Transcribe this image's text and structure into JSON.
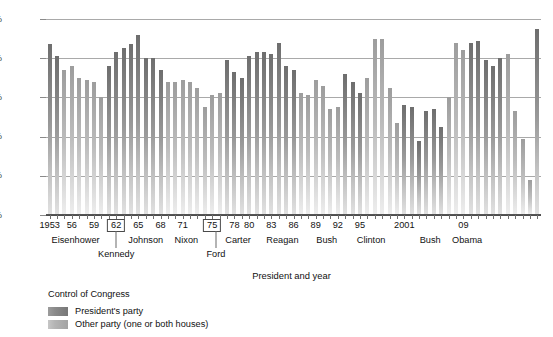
{
  "chart_data": {
    "type": "bar",
    "title": "",
    "xlabel": "President and year",
    "ylabel": "",
    "ylim": [
      0,
      100
    ],
    "ytick_labels": [
      "0%",
      "20%",
      "40%",
      "60%",
      "80%",
      "100%"
    ],
    "ytick_values": [
      0,
      20,
      40,
      60,
      80,
      100
    ],
    "grid": true,
    "legend_title": "Control of Congress",
    "legend": [
      {
        "key": "p",
        "label": "President's party"
      },
      {
        "key": "o",
        "label": "Other party (one or both houses)"
      }
    ],
    "x_tick_labels": [
      {
        "year": 1953,
        "label": "1953",
        "boxed": false
      },
      {
        "year": 1956,
        "label": "56",
        "boxed": false
      },
      {
        "year": 1959,
        "label": "59",
        "boxed": false
      },
      {
        "year": 1962,
        "label": "62",
        "boxed": true
      },
      {
        "year": 1965,
        "label": "65",
        "boxed": false
      },
      {
        "year": 1968,
        "label": "68",
        "boxed": false
      },
      {
        "year": 1971,
        "label": "71",
        "boxed": false
      },
      {
        "year": 1975,
        "label": "75",
        "boxed": true
      },
      {
        "year": 1978,
        "label": "78",
        "boxed": false
      },
      {
        "year": 1980,
        "label": "80",
        "boxed": false
      },
      {
        "year": 1983,
        "label": "83",
        "boxed": false
      },
      {
        "year": 1986,
        "label": "86",
        "boxed": false
      },
      {
        "year": 1989,
        "label": "89",
        "boxed": false
      },
      {
        "year": 1992,
        "label": "92",
        "boxed": false
      },
      {
        "year": 1995,
        "label": "95",
        "boxed": false
      },
      {
        "year": 2001,
        "label": "2001",
        "boxed": false
      },
      {
        "year": 2009,
        "label": "09",
        "boxed": false
      }
    ],
    "presidents": [
      {
        "name": "Eisenhower",
        "row": 1,
        "start": 1953,
        "end": 1960
      },
      {
        "name": "Kennedy",
        "row": 2,
        "start": 1961,
        "end": 1963
      },
      {
        "name": "Johnson",
        "row": 1,
        "start": 1964,
        "end": 1968
      },
      {
        "name": "Nixon",
        "row": 1,
        "start": 1969,
        "end": 1974
      },
      {
        "name": "Ford",
        "row": 2,
        "start": 1975,
        "end": 1976
      },
      {
        "name": "Carter",
        "row": 1,
        "start": 1977,
        "end": 1980
      },
      {
        "name": "Reagan",
        "row": 1,
        "start": 1981,
        "end": 1988
      },
      {
        "name": "Bush",
        "row": 1,
        "start": 1989,
        "end": 1992
      },
      {
        "name": "Clinton",
        "row": 1,
        "start": 1993,
        "end": 2000
      },
      {
        "name": "Bush",
        "row": 1,
        "start": 2001,
        "end": 2008
      },
      {
        "name": "Obama",
        "row": 1,
        "start": 2009,
        "end": 2010
      }
    ],
    "series_colors": {
      "presidents_party": "#7d7d7d",
      "other_party": "#aaaaaa",
      "gridline": "#a9a9a9",
      "axis": "#4d4d4d"
    },
    "points": [
      {
        "year": 1953,
        "value": 87,
        "party": "p"
      },
      {
        "year": 1954,
        "value": 81,
        "party": "p"
      },
      {
        "year": 1955,
        "value": 74,
        "party": "o"
      },
      {
        "year": 1956,
        "value": 76,
        "party": "o"
      },
      {
        "year": 1957,
        "value": 70,
        "party": "o"
      },
      {
        "year": 1958,
        "value": 69,
        "party": "o"
      },
      {
        "year": 1959,
        "value": 68,
        "party": "o"
      },
      {
        "year": 1960,
        "value": 60,
        "party": "o"
      },
      {
        "year": 1961,
        "value": 76,
        "party": "p"
      },
      {
        "year": 1962,
        "value": 83,
        "party": "p"
      },
      {
        "year": 1963,
        "value": 85,
        "party": "p"
      },
      {
        "year": 1964,
        "value": 87,
        "party": "p"
      },
      {
        "year": 1965,
        "value": 92,
        "party": "p"
      },
      {
        "year": 1966,
        "value": 80,
        "party": "p"
      },
      {
        "year": 1967,
        "value": 80,
        "party": "p"
      },
      {
        "year": 1968,
        "value": 74,
        "party": "p"
      },
      {
        "year": 1969,
        "value": 68,
        "party": "o"
      },
      {
        "year": 1970,
        "value": 68,
        "party": "o"
      },
      {
        "year": 1971,
        "value": 69,
        "party": "o"
      },
      {
        "year": 1972,
        "value": 68,
        "party": "o"
      },
      {
        "year": 1973,
        "value": 65,
        "party": "o"
      },
      {
        "year": 1974,
        "value": 55,
        "party": "o"
      },
      {
        "year": 1975,
        "value": 61,
        "party": "o"
      },
      {
        "year": 1976,
        "value": 62,
        "party": "o"
      },
      {
        "year": 1977,
        "value": 79,
        "party": "p"
      },
      {
        "year": 1978,
        "value": 73,
        "party": "p"
      },
      {
        "year": 1979,
        "value": 70,
        "party": "p"
      },
      {
        "year": 1980,
        "value": 81,
        "party": "p"
      },
      {
        "year": 1981,
        "value": 83,
        "party": "p"
      },
      {
        "year": 1982,
        "value": 83,
        "party": "p"
      },
      {
        "year": 1983,
        "value": 82,
        "party": "p"
      },
      {
        "year": 1984,
        "value": 88,
        "party": "p"
      },
      {
        "year": 1985,
        "value": 76,
        "party": "p"
      },
      {
        "year": 1986,
        "value": 74,
        "party": "p"
      },
      {
        "year": 1987,
        "value": 62,
        "party": "o"
      },
      {
        "year": 1988,
        "value": 61,
        "party": "o"
      },
      {
        "year": 1989,
        "value": 69,
        "party": "o"
      },
      {
        "year": 1990,
        "value": 66,
        "party": "o"
      },
      {
        "year": 1991,
        "value": 54,
        "party": "o"
      },
      {
        "year": 1992,
        "value": 55,
        "party": "o"
      },
      {
        "year": 1993,
        "value": 72,
        "party": "p"
      },
      {
        "year": 1994,
        "value": 68,
        "party": "p"
      },
      {
        "year": 1995,
        "value": 62,
        "party": "p"
      },
      {
        "year": 1996,
        "value": 70,
        "party": "o"
      },
      {
        "year": 1997,
        "value": 90,
        "party": "o"
      },
      {
        "year": 1998,
        "value": 90,
        "party": "o"
      },
      {
        "year": 1999,
        "value": 65,
        "party": "o"
      },
      {
        "year": 2000,
        "value": 47,
        "party": "o"
      },
      {
        "year": 2001,
        "value": 56,
        "party": "p"
      },
      {
        "year": 2002,
        "value": 55,
        "party": "p"
      },
      {
        "year": 2003,
        "value": 38,
        "party": "p"
      },
      {
        "year": 2004,
        "value": 53,
        "party": "p"
      },
      {
        "year": 2005,
        "value": 54,
        "party": "p"
      },
      {
        "year": 2006,
        "value": 45,
        "party": "p"
      },
      {
        "year": 2007,
        "value": 60,
        "party": "o"
      },
      {
        "year": 2008,
        "value": 88,
        "party": "o"
      },
      {
        "year": 2009,
        "value": 84,
        "party": "o"
      },
      {
        "year": 2010,
        "value": 88,
        "party": "p"
      },
      {
        "year": 2011,
        "value": 89,
        "party": "p"
      },
      {
        "year": 2012,
        "value": 79,
        "party": "p"
      },
      {
        "year": 2013,
        "value": 76,
        "party": "p"
      },
      {
        "year": 2014,
        "value": 80,
        "party": "p"
      },
      {
        "year": 2015,
        "value": 82,
        "party": "o"
      },
      {
        "year": 2016,
        "value": 53,
        "party": "o"
      },
      {
        "year": 2017,
        "value": 39,
        "party": "o"
      },
      {
        "year": 2018,
        "value": 18,
        "party": "o"
      },
      {
        "year": 2019,
        "value": 95,
        "party": "p"
      }
    ]
  }
}
